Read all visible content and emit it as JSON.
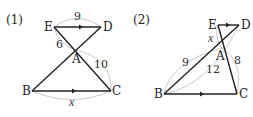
{
  "figures": [
    {
      "id": "1",
      "label": "(1)",
      "points": {
        "E": "E",
        "D": "D",
        "A": "A",
        "B": "B",
        "C": "C"
      },
      "measures": {
        "ED": "9",
        "EA": "6",
        "AC": "10",
        "BC": "x"
      },
      "parallel": [
        "ED",
        "BC"
      ]
    },
    {
      "id": "2",
      "label": "(2)",
      "points": {
        "E": "E",
        "D": "D",
        "A": "A",
        "B": "B",
        "C": "C"
      },
      "measures": {
        "EA": "x",
        "BA": "9",
        "BD": "12",
        "AC": "8"
      },
      "parallel": [
        "ED",
        "BC"
      ]
    }
  ],
  "colors": {
    "line": "#222222",
    "arc": "#bbbbbb",
    "text": "#222222"
  }
}
